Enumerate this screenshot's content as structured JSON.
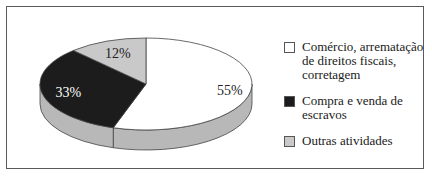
{
  "chart_data": {
    "type": "pie",
    "style": "3d",
    "title": "",
    "slices": [
      {
        "label": "Comércio, arrematação de direitos fiscais, corretagem",
        "value": 55,
        "display": "55%",
        "color": "#ffffff",
        "label_color": "#222222"
      },
      {
        "label": "Compra e venda de escravos",
        "value": 33,
        "display": "33%",
        "color": "#1c1c1c",
        "label_color": "#ffffff"
      },
      {
        "label": "Outras atividades",
        "value": 12,
        "display": "12%",
        "color": "#c9c9c9",
        "label_color": "#222222"
      }
    ],
    "side_color": "#b8b8b8",
    "legend_position": "right"
  },
  "legend": {
    "items": [
      {
        "label": "Comércio, arrematação de direitos fiscais, corretagem",
        "color": "#ffffff"
      },
      {
        "label": "Compra e venda de escravos",
        "color": "#1c1c1c"
      },
      {
        "label": "Outras atividades",
        "color": "#c9c9c9"
      }
    ]
  }
}
